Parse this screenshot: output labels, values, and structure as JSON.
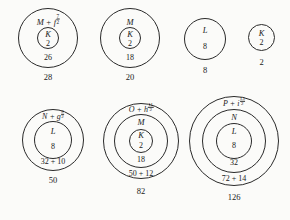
{
  "figure": {
    "type": "nuclear-shell-model-magic-number-diagram",
    "background_color": "#fbfbf9",
    "stroke_color": "#2a2a2a"
  },
  "groups": [
    {
      "id": "group-28",
      "shells": [
        {
          "name": "M",
          "orbital": "f",
          "orbital_sub_num": "7",
          "orbital_sub_den": "2",
          "label_prefix": "M + f",
          "occupancy": "26"
        },
        {
          "name": "K",
          "occupancy": "2"
        }
      ],
      "magic_number": "28"
    },
    {
      "id": "group-20",
      "shells": [
        {
          "name": "M",
          "occupancy": "18"
        },
        {
          "name": "K",
          "occupancy": "2"
        }
      ],
      "magic_number": "20"
    },
    {
      "id": "group-8",
      "shells": [
        {
          "name": "L",
          "occupancy": "8"
        }
      ],
      "magic_number": "8"
    },
    {
      "id": "group-2",
      "shells": [
        {
          "name": "K",
          "occupancy": "2"
        }
      ],
      "magic_number": "2"
    },
    {
      "id": "group-50",
      "shells": [
        {
          "name": "N",
          "orbital": "g",
          "orbital_sub_num": "9",
          "orbital_sub_den": "2",
          "label_prefix": "N + g",
          "occupancy": "32 + 10"
        },
        {
          "name": "L",
          "occupancy": "8"
        }
      ],
      "magic_number": "50"
    },
    {
      "id": "group-82",
      "shells": [
        {
          "name": "O",
          "orbital": "h",
          "orbital_sub_num": "11",
          "orbital_sub_den": "2",
          "label_prefix": "O + h",
          "occupancy": "50 + 12"
        },
        {
          "name": "M",
          "occupancy": "18"
        },
        {
          "name": "K",
          "occupancy": "2"
        }
      ],
      "magic_number": "82"
    },
    {
      "id": "group-126",
      "shells": [
        {
          "name": "P",
          "orbital": "i",
          "orbital_sub_num": "13",
          "orbital_sub_den": "2",
          "label_prefix": "P + i",
          "occupancy": "72 + 14"
        },
        {
          "name": "N",
          "occupancy": "32"
        },
        {
          "name": "L",
          "occupancy": "8"
        }
      ],
      "magic_number": "126"
    }
  ]
}
